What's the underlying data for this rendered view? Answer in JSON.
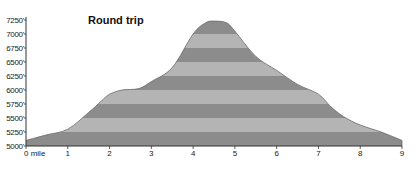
{
  "chart_data": {
    "type": "area",
    "title": "Round trip",
    "xlabel": "",
    "ylabel": "",
    "x_unit": "mile",
    "y_unit": "ft",
    "xlim": [
      0,
      9
    ],
    "ylim": [
      5000,
      7250
    ],
    "x_ticks": [
      0,
      1,
      2,
      3,
      4,
      5,
      6,
      7,
      8,
      9
    ],
    "x_tick_labels": [
      "0 mile",
      "1",
      "2",
      "3",
      "4",
      "5",
      "6",
      "7",
      "8",
      "9"
    ],
    "y_ticks": [
      5000,
      5250,
      5500,
      5750,
      6000,
      6250,
      6500,
      6750,
      7000,
      7250
    ],
    "y_tick_labels": [
      "5000'",
      "5250'",
      "5500'",
      "5750'",
      "6000'",
      "6250'",
      "6500'",
      "6750'",
      "7000'",
      "7250'"
    ],
    "grid": false,
    "legend": null,
    "bands": {
      "step": 250,
      "dark_color": "#8c8c8c",
      "light_color": "#b4b4b4",
      "bottom_band": "dark"
    },
    "series": [
      {
        "name": "Elevation",
        "x": [
          0,
          0.5,
          1,
          1.5,
          1.8,
          2,
          2.3,
          2.7,
          3,
          3.5,
          4,
          4.3,
          4.5,
          4.8,
          5,
          5.5,
          6,
          6.5,
          7,
          7.3,
          7.6,
          8,
          8.5,
          9
        ],
        "values": [
          5100,
          5200,
          5300,
          5600,
          5800,
          5925,
          6000,
          6025,
          6150,
          6400,
          7000,
          7200,
          7230,
          7200,
          7050,
          6600,
          6350,
          6100,
          5925,
          5700,
          5525,
          5375,
          5250,
          5100
        ]
      }
    ]
  }
}
